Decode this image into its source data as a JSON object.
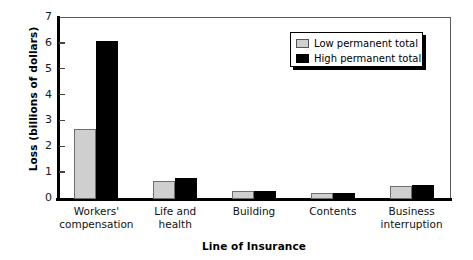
{
  "chart_data": {
    "type": "bar",
    "title": "",
    "xlabel": "Line of Insurance",
    "ylabel": "Loss (billions of dollars)",
    "categories": [
      "Workers'\ncompensation",
      "Life and\nhealth",
      "Building",
      "Contents",
      "Business\ninterruption"
    ],
    "category_lines": [
      [
        "Workers'",
        "compensation"
      ],
      [
        "Life and",
        "health"
      ],
      [
        "Building",
        ""
      ],
      [
        "Contents",
        ""
      ],
      [
        "Business",
        "interruption"
      ]
    ],
    "series": [
      {
        "name": "Low permanent total",
        "color": "#cfcfcf",
        "values": [
          2.7,
          0.7,
          0.3,
          0.25,
          0.5
        ]
      },
      {
        "name": "High permanent total",
        "color": "#000000",
        "values": [
          6.1,
          0.8,
          0.3,
          0.25,
          0.55
        ]
      }
    ],
    "ylim": [
      0,
      7
    ],
    "yticks": [
      0,
      1,
      2,
      3,
      4,
      5,
      6,
      7
    ],
    "ytick_labels": [
      "0",
      "1",
      "2",
      "3",
      "4",
      "5",
      "6",
      "7"
    ],
    "grid": false,
    "legend_position": "upper right"
  },
  "legend": {
    "items": [
      {
        "label": "Low permanent total",
        "swatch": "low"
      },
      {
        "label": "High permanent total",
        "swatch": "high"
      }
    ]
  }
}
